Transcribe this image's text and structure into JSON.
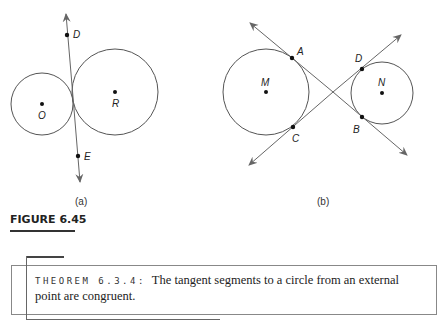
{
  "figure": {
    "caption": "FIGURE 6.45",
    "subfigures": [
      {
        "label": "(a)",
        "circles": [
          {
            "center_label": "O",
            "cx": 42,
            "cy": 104,
            "r": 31
          },
          {
            "center_label": "R",
            "cx": 115,
            "cy": 92,
            "r": 43
          }
        ],
        "line": {
          "x1": 66,
          "y1": 13,
          "x2": 80,
          "y2": 182
        },
        "points": [
          {
            "label": "D",
            "x": 67,
            "y": 35
          },
          {
            "label": "E",
            "x": 78,
            "y": 156
          }
        ]
      },
      {
        "label": "(b)",
        "circles": [
          {
            "center_label": "M",
            "cx": 266,
            "cy": 92,
            "r": 43
          },
          {
            "center_label": "N",
            "cx": 382,
            "cy": 93,
            "r": 31
          }
        ],
        "lines": [
          {
            "x1": 250,
            "y1": 23,
            "x2": 407,
            "y2": 155
          },
          {
            "x1": 249,
            "y1": 165,
            "x2": 401,
            "y2": 35
          }
        ],
        "points": [
          {
            "label": "A",
            "x": 292,
            "y": 58
          },
          {
            "label": "C",
            "x": 293,
            "y": 127
          },
          {
            "label": "D",
            "x": 362,
            "y": 69
          },
          {
            "label": "B",
            "x": 362,
            "y": 117
          }
        ]
      }
    ]
  },
  "theorem": {
    "label": "THEOREM 6.3.4:",
    "text": "The tangent segments to a circle from an external point are congruent."
  }
}
